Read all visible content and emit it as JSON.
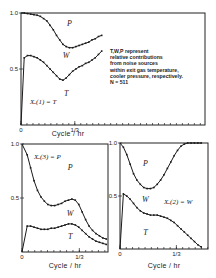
{
  "chart_data": [
    {
      "type": "line",
      "panel": "top",
      "title": "",
      "panel_label": "Xₑ(1) = T",
      "xlabel": "Cycle / hr",
      "ylabel": "",
      "xlim": [
        0,
        1.14
      ],
      "ylim": [
        0,
        1.0
      ],
      "xticks": [
        {
          "value": 0,
          "label": "0"
        },
        {
          "value": 0.3333,
          "label": "1/3"
        }
      ],
      "yticks": [
        {
          "value": 0.5,
          "label": "0.5"
        },
        {
          "value": 1.0,
          "label": "1.0"
        }
      ],
      "region_labels": [
        {
          "text": "P",
          "x": 0.3,
          "y": 0.88
        },
        {
          "text": "W",
          "x": 0.28,
          "y": 0.6
        },
        {
          "text": "T",
          "x": 0.28,
          "y": 0.26
        }
      ],
      "annotation": [
        "T,W,P represent",
        "relative contributions",
        "from noise sources",
        "within exit gas temperature,",
        "cooler pressure, respectively.",
        "N = 511"
      ],
      "series": [
        {
          "name": "T/W boundary",
          "x": [
            0,
            0.02,
            0.04,
            0.06,
            0.08,
            0.1,
            0.12,
            0.14,
            0.16,
            0.18,
            0.2,
            0.22,
            0.24,
            0.26,
            0.28,
            0.3,
            0.32,
            0.34,
            0.36,
            0.38,
            0.4,
            0.42,
            0.44,
            0.46,
            0.48,
            0.5
          ],
          "y": [
            0.0,
            0.6,
            0.62,
            0.62,
            0.61,
            0.6,
            0.58,
            0.56,
            0.53,
            0.5,
            0.47,
            0.44,
            0.41,
            0.4,
            0.42,
            0.45,
            0.48,
            0.5,
            0.52,
            0.53,
            0.55,
            0.56,
            0.58,
            0.6,
            0.63,
            0.66
          ]
        },
        {
          "name": "W/P boundary",
          "x": [
            0,
            0.02,
            0.04,
            0.06,
            0.08,
            0.1,
            0.12,
            0.14,
            0.16,
            0.18,
            0.2,
            0.22,
            0.24,
            0.26,
            0.28,
            0.3,
            0.32,
            0.34,
            0.36,
            0.38,
            0.4,
            0.42,
            0.44,
            0.46,
            0.48,
            0.5
          ],
          "y": [
            1.0,
            1.0,
            0.995,
            0.99,
            0.985,
            0.98,
            0.97,
            0.95,
            0.93,
            0.89,
            0.85,
            0.8,
            0.76,
            0.72,
            0.7,
            0.69,
            0.69,
            0.7,
            0.71,
            0.72,
            0.73,
            0.74,
            0.76,
            0.77,
            0.79,
            0.8
          ]
        }
      ]
    },
    {
      "type": "line",
      "panel": "bottom-left",
      "title": "",
      "panel_label": "Xₑ(3) = P",
      "xlabel": "Cycle / hr",
      "ylabel": "",
      "xlim": [
        0,
        0.5
      ],
      "ylim": [
        0,
        1.0
      ],
      "xticks": [
        {
          "value": 0,
          "label": "0"
        },
        {
          "value": 0.3333,
          "label": "1/3"
        }
      ],
      "yticks": [
        {
          "value": 0.5,
          "label": "0.5"
        },
        {
          "value": 1.0,
          "label": "1.0"
        }
      ],
      "region_labels": [
        {
          "text": "P",
          "x": 0.28,
          "y": 0.76
        },
        {
          "text": "W",
          "x": 0.28,
          "y": 0.33
        },
        {
          "text": "T",
          "x": 0.28,
          "y": 0.12
        }
      ],
      "series": [
        {
          "name": "T/W boundary",
          "x": [
            0,
            0.03,
            0.05,
            0.07,
            0.09,
            0.11,
            0.13,
            0.15,
            0.17,
            0.19,
            0.21,
            0.23,
            0.25,
            0.27,
            0.29,
            0.31,
            0.33,
            0.35,
            0.37,
            0.39,
            0.41,
            0.43,
            0.45,
            0.47,
            0.49
          ],
          "y": [
            0.0,
            0.24,
            0.24,
            0.23,
            0.22,
            0.21,
            0.21,
            0.21,
            0.22,
            0.22,
            0.23,
            0.24,
            0.25,
            0.26,
            0.26,
            0.25,
            0.23,
            0.2,
            0.17,
            0.14,
            0.12,
            0.1,
            0.09,
            0.08,
            0.07
          ]
        },
        {
          "name": "W/P boundary",
          "x": [
            0,
            0.03,
            0.05,
            0.07,
            0.09,
            0.11,
            0.13,
            0.15,
            0.17,
            0.19,
            0.21,
            0.23,
            0.25,
            0.27,
            0.29,
            0.31,
            0.33,
            0.35,
            0.37,
            0.39,
            0.41,
            0.43,
            0.45,
            0.47,
            0.49
          ],
          "y": [
            1.0,
            0.9,
            0.78,
            0.66,
            0.57,
            0.51,
            0.47,
            0.44,
            0.43,
            0.43,
            0.44,
            0.45,
            0.47,
            0.48,
            0.49,
            0.48,
            0.44,
            0.37,
            0.3,
            0.24,
            0.2,
            0.17,
            0.15,
            0.13,
            0.12
          ]
        }
      ]
    },
    {
      "type": "line",
      "panel": "bottom-right",
      "title": "",
      "panel_label": "Xₑ(2) = W",
      "xlabel": "Cycle / hr",
      "ylabel": "",
      "xlim": [
        0,
        0.52
      ],
      "ylim": [
        0,
        1.0
      ],
      "xticks": [
        {
          "value": 0,
          "label": "0"
        },
        {
          "value": 0.3333,
          "label": "1/3"
        }
      ],
      "yticks": [
        {
          "value": 0.5,
          "label": "0.5"
        },
        {
          "value": 1.0,
          "label": "1.0"
        }
      ],
      "region_labels": [
        {
          "text": "P",
          "x": 0.15,
          "y": 0.78
        },
        {
          "text": "W",
          "x": 0.15,
          "y": 0.44
        },
        {
          "text": "T",
          "x": 0.15,
          "y": 0.13
        }
      ],
      "series": [
        {
          "name": "T/W boundary",
          "x": [
            0,
            0.02,
            0.04,
            0.06,
            0.08,
            0.1,
            0.12,
            0.14,
            0.16,
            0.18,
            0.2,
            0.22,
            0.24,
            0.26,
            0.28,
            0.3,
            0.32,
            0.34,
            0.36,
            0.38,
            0.4,
            0.42,
            0.44,
            0.46,
            0.48
          ],
          "y": [
            0.0,
            0.52,
            0.5,
            0.47,
            0.43,
            0.39,
            0.36,
            0.34,
            0.33,
            0.32,
            0.32,
            0.32,
            0.31,
            0.3,
            0.29,
            0.27,
            0.25,
            0.22,
            0.19,
            0.16,
            0.13,
            0.1,
            0.07,
            0.04,
            0.02
          ]
        },
        {
          "name": "W/P boundary",
          "x": [
            0,
            0.02,
            0.04,
            0.06,
            0.08,
            0.1,
            0.12,
            0.14,
            0.16,
            0.18,
            0.2,
            0.22,
            0.24,
            0.26,
            0.28,
            0.3,
            0.32,
            0.34,
            0.36,
            0.38,
            0.4,
            0.42,
            0.44,
            0.46,
            0.48
          ],
          "y": [
            1.0,
            0.96,
            0.89,
            0.8,
            0.71,
            0.65,
            0.61,
            0.58,
            0.57,
            0.57,
            0.58,
            0.61,
            0.65,
            0.7,
            0.76,
            0.82,
            0.88,
            0.93,
            0.97,
            0.99,
            1.0,
            1.0,
            1.0,
            1.0,
            1.0
          ]
        }
      ]
    }
  ]
}
